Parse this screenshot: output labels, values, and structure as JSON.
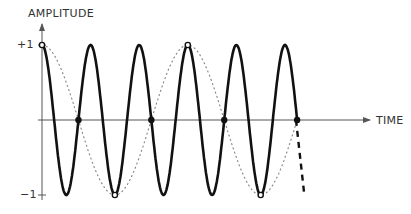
{
  "diagram": {
    "y_axis_label": "AMPLITUDE",
    "x_axis_label": "TIME",
    "y_ticks": {
      "plus_one": "+1",
      "minus_one": "−1"
    },
    "colors": {
      "signal": "#111111",
      "alias": "#888888",
      "axis": "#555555",
      "background": "#ffffff"
    }
  },
  "chart_data": {
    "type": "line",
    "xlabel": "TIME",
    "ylabel": "AMPLITUDE",
    "ylim": [
      -1,
      1
    ],
    "y_tick_labels": [
      "+1",
      "−1"
    ],
    "grid": false,
    "series": [
      {
        "name": "original signal (solid)",
        "style": "solid",
        "cycles_shown": 5.25,
        "phase": "cosine, starts at +1"
      },
      {
        "name": "aliased signal (dotted)",
        "style": "dotted",
        "cycles_shown": 1.75,
        "phase": "cosine, starts at +1"
      }
    ],
    "sample_points": {
      "open_circles": [
        {
          "t": 0,
          "y": 1
        },
        {
          "t": 1.5,
          "y": -1
        },
        {
          "t": 3.0,
          "y": 1
        },
        {
          "t": 4.5,
          "y": -1
        }
      ],
      "filled_dots": [
        {
          "t": 0.75,
          "y": 0
        },
        {
          "t": 2.25,
          "y": 0
        },
        {
          "t": 3.75,
          "y": 0
        },
        {
          "t": 5.25,
          "y": 0
        }
      ]
    },
    "annotations": [
      "dashed continuation of solid signal after last sample"
    ]
  }
}
